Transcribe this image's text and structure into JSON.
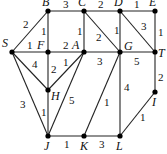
{
  "graph": {
    "nodes": [
      {
        "id": "S",
        "x": 12,
        "y": 52,
        "lx": 2,
        "ly": 47
      },
      {
        "id": "B",
        "x": 48,
        "y": 11,
        "lx": 42,
        "ly": 6
      },
      {
        "id": "C",
        "x": 84,
        "y": 11,
        "lx": 78,
        "ly": 6
      },
      {
        "id": "D",
        "x": 120,
        "y": 11,
        "lx": 114,
        "ly": 6
      },
      {
        "id": "E",
        "x": 155,
        "y": 11,
        "lx": 149,
        "ly": 6
      },
      {
        "id": "F",
        "x": 48,
        "y": 52,
        "lx": 37,
        "ly": 49
      },
      {
        "id": "A",
        "x": 84,
        "y": 52,
        "lx": 72,
        "ly": 49
      },
      {
        "id": "G",
        "x": 120,
        "y": 52,
        "lx": 124,
        "ly": 50
      },
      {
        "id": "T",
        "x": 155,
        "y": 52,
        "lx": 158,
        "ly": 57
      },
      {
        "id": "H",
        "x": 48,
        "y": 90,
        "lx": 51,
        "ly": 100
      },
      {
        "id": "I",
        "x": 155,
        "y": 92,
        "lx": 152,
        "ly": 106
      },
      {
        "id": "J",
        "x": 48,
        "y": 136,
        "lx": 44,
        "ly": 150
      },
      {
        "id": "K",
        "x": 84,
        "y": 136,
        "lx": 80,
        "ly": 150
      },
      {
        "id": "L",
        "x": 120,
        "y": 136,
        "lx": 116,
        "ly": 150
      }
    ],
    "edges": [
      {
        "from": "S",
        "to": "B",
        "w": "2",
        "wx": 23,
        "wy": 28
      },
      {
        "from": "S",
        "to": "F",
        "w": "1",
        "wx": 27,
        "wy": 49
      },
      {
        "from": "S",
        "to": "H",
        "w": "4",
        "wx": 32,
        "wy": 68
      },
      {
        "from": "S",
        "to": "J",
        "w": "3",
        "wx": 20,
        "wy": 108
      },
      {
        "from": "B",
        "to": "C",
        "w": "3",
        "wx": 63,
        "wy": 8
      },
      {
        "from": "B",
        "to": "F",
        "w": "1",
        "wx": 41,
        "wy": 35
      },
      {
        "from": "C",
        "to": "D",
        "w": "2",
        "wx": 98,
        "wy": 8
      },
      {
        "from": "C",
        "to": "A",
        "w": "1",
        "wx": 77,
        "wy": 35
      },
      {
        "from": "C",
        "to": "G",
        "w": "2",
        "wx": 96,
        "wy": 41
      },
      {
        "from": "D",
        "to": "E",
        "w": "1",
        "wx": 134,
        "wy": 8
      },
      {
        "from": "D",
        "to": "G",
        "w": "1",
        "wx": 114,
        "wy": 34
      },
      {
        "from": "D",
        "to": "T",
        "w": "3",
        "wx": 141,
        "wy": 30
      },
      {
        "from": "E",
        "to": "T",
        "w": "1",
        "wx": 158,
        "wy": 36
      },
      {
        "from": "F",
        "to": "A",
        "w": "2",
        "wx": 63,
        "wy": 49
      },
      {
        "from": "F",
        "to": "H",
        "w": "2",
        "wx": 51,
        "wy": 73
      },
      {
        "from": "A",
        "to": "H",
        "w": "1",
        "wx": 63,
        "wy": 66
      },
      {
        "from": "A",
        "to": "G",
        "w": "3",
        "wx": 97,
        "wy": 65
      },
      {
        "from": "A",
        "to": "J",
        "w": "5",
        "wx": 69,
        "wy": 104
      },
      {
        "from": "G",
        "to": "T",
        "w": "5",
        "wx": 134,
        "wy": 65
      },
      {
        "from": "G",
        "to": "K",
        "w": "1",
        "wx": 104,
        "wy": 106
      },
      {
        "from": "G",
        "to": "L",
        "w": "4",
        "wx": 124,
        "wy": 91
      },
      {
        "from": "T",
        "to": "I",
        "w": "2",
        "wx": 158,
        "wy": 81
      },
      {
        "from": "I",
        "to": "L",
        "w": "1",
        "wx": 140,
        "wy": 121
      },
      {
        "from": "H",
        "to": "J",
        "w": "1",
        "wx": 41,
        "wy": 116
      },
      {
        "from": "J",
        "to": "K",
        "w": "1",
        "wx": 64,
        "wy": 148
      },
      {
        "from": "K",
        "to": "L",
        "w": "3",
        "wx": 99,
        "wy": 148
      }
    ]
  }
}
